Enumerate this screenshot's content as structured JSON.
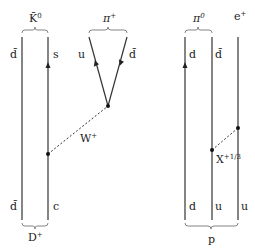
{
  "diagram": {
    "title": "",
    "left": {
      "top_meson": {
        "label": "K̄",
        "superscript": "0"
      },
      "bottom_meson": {
        "label": "D",
        "superscript": "+"
      },
      "quark_lines": [
        {
          "top_label": "d̄",
          "bottom_label": "d̄",
          "arrow": "none"
        },
        {
          "top_label": "s",
          "bottom_label": "c",
          "arrow": "up"
        }
      ],
      "pion": {
        "label": "π",
        "superscript": "+",
        "legs": [
          {
            "label": "u",
            "arrow": "up"
          },
          {
            "label": "d̄",
            "arrow": "down"
          }
        ]
      },
      "boson": {
        "label": "W",
        "superscript": "+"
      }
    },
    "right": {
      "top_meson": {
        "label": "π",
        "superscript": "0"
      },
      "lepton": {
        "label": "e",
        "superscript": "+"
      },
      "bottom_baryon": {
        "label": "p"
      },
      "quark_lines": [
        {
          "top_label": "d",
          "bottom_label": "d",
          "arrow": "up"
        },
        {
          "top_label": "d̄",
          "bottom_label": "u",
          "arrow": "none"
        },
        {
          "top_label": "",
          "bottom_label": "u",
          "arrow": "none"
        }
      ],
      "boson": {
        "label": "X",
        "superscript": "+1/3"
      }
    }
  }
}
